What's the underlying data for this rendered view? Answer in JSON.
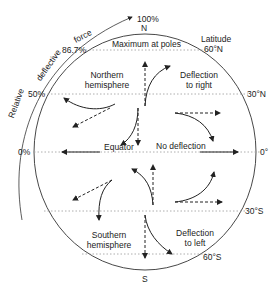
{
  "diagram": {
    "pole_north": "N",
    "pole_south": "S",
    "top_percent": "100%",
    "percent_86": "86.7%",
    "percent_50": "50%",
    "percent_0": "0%",
    "arc_label": [
      "Relative",
      "deflective",
      "force"
    ],
    "maximum_label": "Maximum at poles",
    "latitude_label": "Latitude",
    "lat_60n": "60°N",
    "lat_30n": "30°N",
    "lat_0": "0°",
    "lat_30s": "30°S",
    "lat_60s": "60°S",
    "northern_line1": "Northern",
    "northern_line2": "hemisphere",
    "southern_line1": "Southern",
    "southern_line2": "hemisphere",
    "deflect_right_line1": "Deflection",
    "deflect_right_line2": "to right",
    "deflect_left_line1": "Deflection",
    "deflect_left_line2": "to left",
    "equator_label": "Equator",
    "no_deflection": "No deflection"
  }
}
